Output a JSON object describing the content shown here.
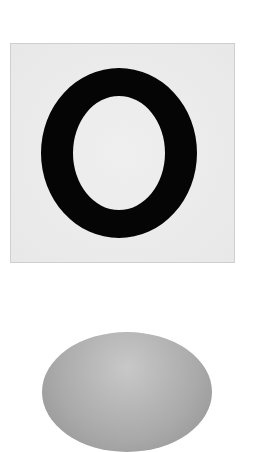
{
  "card": {
    "letter": "O",
    "background_color": "#ececec",
    "letter_color": "#050505"
  },
  "dome": {
    "color": "#b0b0b0"
  }
}
